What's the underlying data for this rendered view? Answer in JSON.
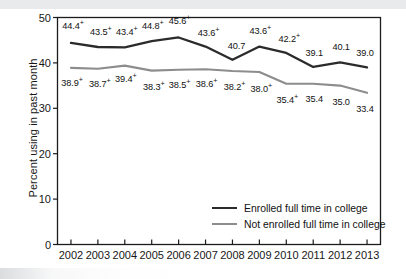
{
  "chart_data": {
    "type": "line",
    "title": "",
    "xlabel": "",
    "ylabel": "Percent using in past month",
    "ylim": [
      0,
      50
    ],
    "yticks": [
      0,
      10,
      20,
      30,
      40,
      50
    ],
    "grid": false,
    "legend_position": "inside-bottom-right",
    "categories": [
      "2002",
      "2003",
      "2004",
      "2005",
      "2006",
      "2007",
      "2008",
      "2009",
      "2010",
      "2011",
      "2012",
      "2013"
    ],
    "series": [
      {
        "name": "Enrolled full time in college",
        "color": "#2b2b2b",
        "values": [
          44.4,
          43.5,
          43.4,
          44.8,
          45.6,
          43.6,
          40.7,
          43.6,
          42.2,
          39.1,
          40.1,
          39.0
        ],
        "labels": [
          "44.4+",
          "43.5+",
          "43.4+",
          "44.8+",
          "45.6+",
          "43.6+",
          "40.7",
          "43.6+",
          "42.2+",
          "39.1",
          "40.1",
          "39.0"
        ],
        "significance_marker": [
          "+",
          "+",
          "+",
          "+",
          "+",
          "+",
          "",
          "+",
          "+",
          "",
          "",
          ""
        ]
      },
      {
        "name": "Not enrolled full time in college",
        "color": "#8d8d8d",
        "values": [
          38.9,
          38.7,
          39.4,
          38.3,
          38.5,
          38.6,
          38.2,
          38.0,
          35.4,
          35.4,
          35.0,
          33.4
        ],
        "labels": [
          "38.9+",
          "38.7+",
          "39.4+",
          "38.3+",
          "38.5+",
          "38.6+",
          "38.2+",
          "38.0+",
          "35.4+",
          "35.4",
          "35.0",
          "33.4"
        ],
        "significance_marker": [
          "+",
          "+",
          "+",
          "+",
          "+",
          "+",
          "+",
          "+",
          "+",
          "",
          "",
          ""
        ]
      }
    ],
    "label_offsets": {
      "series_0": [
        {
          "dx": 2,
          "dy": -17
        },
        {
          "dx": 3,
          "dy": -15
        },
        {
          "dx": 2,
          "dy": -15
        },
        {
          "dx": 1,
          "dy": -15
        },
        {
          "dx": 1,
          "dy": -16
        },
        {
          "dx": 3,
          "dy": -14
        },
        {
          "dx": 4,
          "dy": -14
        },
        {
          "dx": 1,
          "dy": -16
        },
        {
          "dx": 3,
          "dy": -14
        },
        {
          "dx": 1,
          "dy": -14
        },
        {
          "dx": 1,
          "dy": -15
        },
        {
          "dx": -2,
          "dy": -14
        }
      ],
      "series_1": [
        {
          "dx": 1,
          "dy": 15
        },
        {
          "dx": 2,
          "dy": 15
        },
        {
          "dx": 1,
          "dy": 13
        },
        {
          "dx": 2,
          "dy": 16
        },
        {
          "dx": 1,
          "dy": 15
        },
        {
          "dx": 1,
          "dy": 15
        },
        {
          "dx": 2,
          "dy": 16
        },
        {
          "dx": 2,
          "dy": 17
        },
        {
          "dx": 1,
          "dy": 16
        },
        {
          "dx": 1,
          "dy": 15
        },
        {
          "dx": 1,
          "dy": 16
        },
        {
          "dx": -2,
          "dy": 16
        }
      ]
    }
  },
  "legend": {
    "items": [
      {
        "label": "Enrolled full time in college",
        "color": "#2b2b2b"
      },
      {
        "label": "Not enrolled full time in college",
        "color": "#8d8d8d"
      }
    ]
  },
  "axes": {
    "y_title": "Percent using in past month",
    "y_tick_labels": [
      "50",
      "40",
      "30",
      "20",
      "10",
      "0"
    ],
    "x_tick_labels": [
      "2002",
      "2003",
      "2004",
      "2005",
      "2006",
      "2007",
      "2008",
      "2009",
      "2010",
      "2011",
      "2012",
      "2013"
    ]
  }
}
